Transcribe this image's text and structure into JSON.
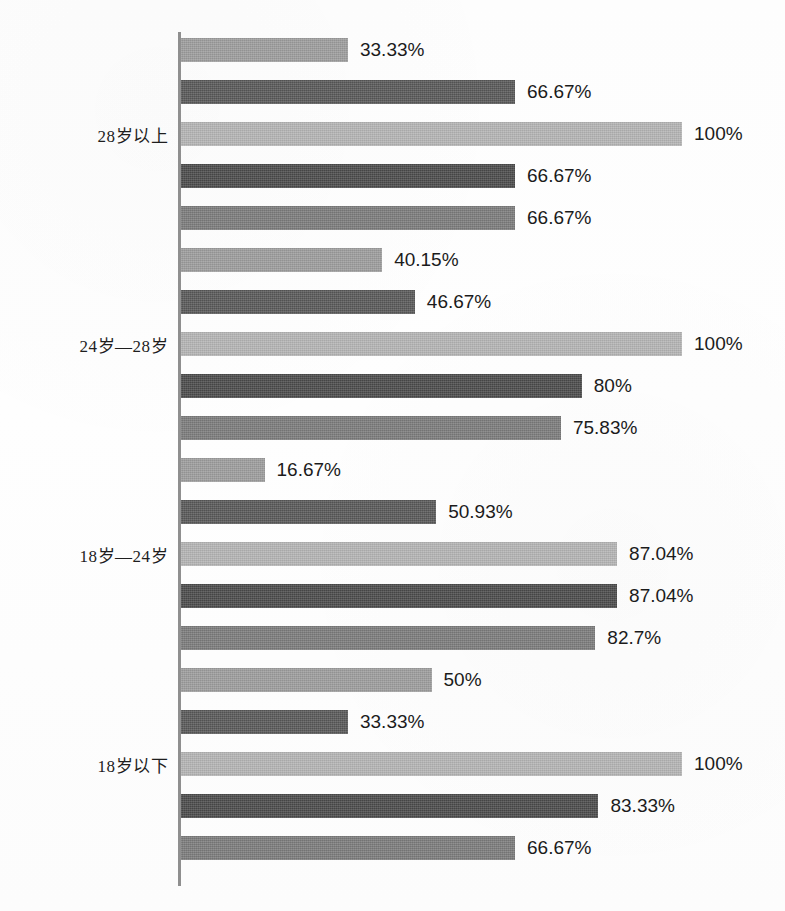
{
  "chart_data": {
    "type": "bar",
    "orientation": "horizontal",
    "title": "",
    "subtitle": "",
    "xlabel": "",
    "ylabel": "",
    "xlim": [
      0,
      100
    ],
    "grid": false,
    "legend": "none",
    "value_suffix": "%",
    "categories": [
      "28岁以上",
      "24岁—28岁",
      "18岁—24岁",
      "18岁以下"
    ],
    "series": [
      {
        "name": "series-1",
        "color": "#9c9c9c",
        "values": [
          33.33,
          40.15,
          16.67,
          50
        ],
        "labels": [
          "33.33%",
          "40.15%",
          "16.67%",
          "50%"
        ]
      },
      {
        "name": "series-2",
        "color": "#585858",
        "values": [
          66.67,
          46.67,
          50.93,
          33.33
        ],
        "labels": [
          "66.67%",
          "46.67%",
          "50.93%",
          "33.33%"
        ]
      },
      {
        "name": "series-3",
        "color": "#b4b4b4",
        "values": [
          100,
          100,
          87.04,
          100
        ],
        "labels": [
          "100%",
          "100%",
          "87.04%",
          "100%"
        ]
      },
      {
        "name": "series-4",
        "color": "#4a4a4a",
        "values": [
          66.67,
          80,
          87.04,
          83.33
        ],
        "labels": [
          "66.67%",
          "80%",
          "87.04%",
          "83.33%"
        ]
      },
      {
        "name": "series-5",
        "color": "#7b7b7b",
        "values": [
          66.67,
          75.83,
          82.7,
          66.67
        ],
        "labels": [
          "66.67%",
          "75.83%",
          "82.7%",
          "66.67%"
        ]
      }
    ],
    "axis_color": "#8f8f8f"
  },
  "layout": {
    "axis_x": 178,
    "axis_top": 32,
    "axis_bottom": 886,
    "px_per_percent": 5.01,
    "bar_height": 24,
    "bar_pitch": 42,
    "group_pitch": 210,
    "first_bar_top": 38,
    "value_gap": 12,
    "label_right_edge": 168
  }
}
